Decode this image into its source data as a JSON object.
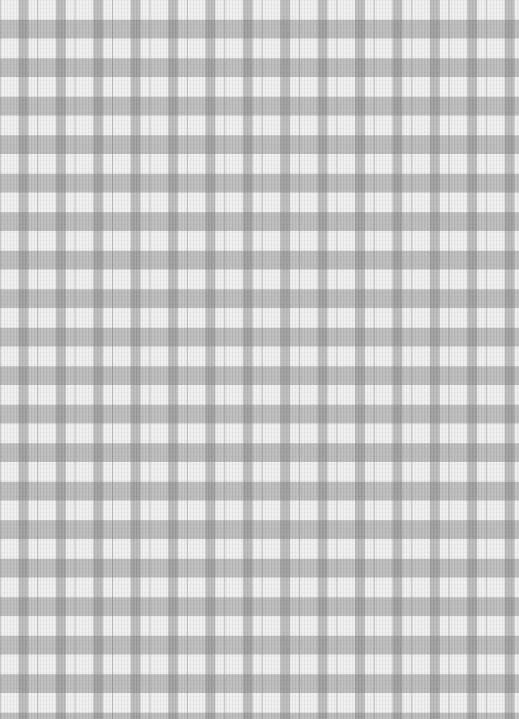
{
  "image": {
    "subject": "gingham check fabric",
    "pattern": "gingham",
    "colors": {
      "background_white": "#f0f0f0",
      "band_gray": "#c4c4c4",
      "intersection_gray": "#a8a8a8"
    },
    "check_period_px": {
      "horizontal": 37.4,
      "vertical": 38.5
    }
  }
}
